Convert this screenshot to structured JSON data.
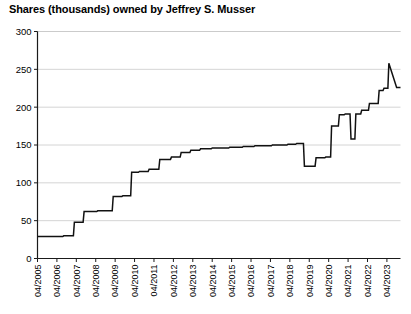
{
  "chart_data": {
    "type": "line",
    "title": "Shares (thousands) owned by Jeffrey S. Musser",
    "xlabel": "",
    "ylabel": "",
    "ylim": [
      0,
      300
    ],
    "yticks": [
      0,
      50,
      100,
      150,
      200,
      250,
      300
    ],
    "ytick_labels": [
      "0",
      "50",
      "100",
      "150",
      "200",
      "250",
      "300"
    ],
    "xtick_labels": [
      "04/2005",
      "04/2006",
      "04/2007",
      "04/2008",
      "04/2009",
      "04/2010",
      "04/2011",
      "04/2012",
      "04/2013",
      "04/2014",
      "04/2015",
      "04/2016",
      "04/2017",
      "04/2018",
      "04/2019",
      "04/2020",
      "04/2021",
      "04/2022",
      "04/2023"
    ],
    "grid": true,
    "legend": false,
    "step_style": "post",
    "line_color": "#111111",
    "grid_color": "#c9c9c9",
    "x": [
      2005.25,
      2006.55,
      2006.6,
      2007.1,
      2007.15,
      2007.6,
      2007.65,
      2008.3,
      2008.35,
      2009.1,
      2009.15,
      2009.6,
      2009.65,
      2010.05,
      2010.1,
      2010.45,
      2010.5,
      2010.95,
      2011.0,
      2011.5,
      2011.55,
      2012.1,
      2012.15,
      2012.6,
      2012.65,
      2013.1,
      2013.15,
      2013.6,
      2013.65,
      2014.2,
      2014.25,
      2015.1,
      2015.15,
      2015.8,
      2015.85,
      2016.4,
      2016.45,
      2017.3,
      2017.35,
      2018.1,
      2018.15,
      2018.55,
      2018.6,
      2018.95,
      2019.0,
      2019.55,
      2019.6,
      2020.05,
      2020.1,
      2020.35,
      2020.4,
      2020.75,
      2020.8,
      2021.05,
      2021.1,
      2021.35,
      2021.4,
      2021.6,
      2021.65,
      2021.9,
      2021.95,
      2022.3,
      2022.35,
      2022.8,
      2022.85,
      2023.05,
      2023.1,
      2023.3,
      2023.35,
      2023.75
    ],
    "values": [
      29,
      29,
      30,
      30,
      48,
      48,
      62,
      62,
      63,
      63,
      82,
      82,
      83,
      83,
      114,
      114,
      115,
      115,
      118,
      118,
      131,
      131,
      134,
      134,
      140,
      140,
      143,
      143,
      145,
      145,
      146,
      146,
      147,
      147,
      148,
      148,
      149,
      149,
      150,
      150,
      151,
      151,
      152,
      152,
      122,
      122,
      133,
      133,
      134,
      134,
      175,
      175,
      190,
      190,
      191,
      191,
      158,
      158,
      191,
      191,
      196,
      196,
      205,
      205,
      222,
      222,
      225,
      225,
      258,
      226
    ],
    "series_name": "Shares owned"
  },
  "axis": {
    "y_title": "",
    "x_title": ""
  }
}
